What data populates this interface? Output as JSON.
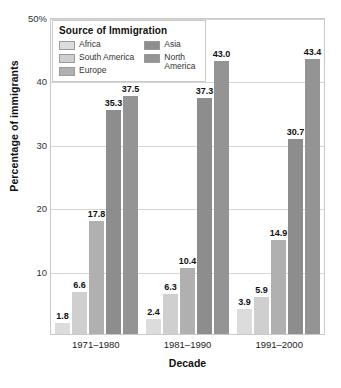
{
  "chart_data": {
    "type": "bar",
    "title": "",
    "xlabel": "Decade",
    "ylabel": "Percentage of immigrants",
    "ylim": [
      0,
      50
    ],
    "yticks": [
      10,
      20,
      30,
      40,
      50
    ],
    "ytick_labels": [
      "10",
      "20",
      "30",
      "40",
      "50%"
    ],
    "grid": true,
    "legend_title": "Source of Immigration",
    "legend_position": "top-left-inside",
    "categories": [
      "1971–1980",
      "1981–1990",
      "1991–2000"
    ],
    "series": [
      {
        "name": "Africa",
        "color": "#dcdcdc",
        "values": [
          1.8,
          2.4,
          3.9
        ]
      },
      {
        "name": "South America",
        "color": "#cfcfcf",
        "values": [
          6.6,
          6.3,
          5.9
        ]
      },
      {
        "name": "Europe",
        "color": "#b0b0b0",
        "values": [
          17.8,
          10.4,
          14.9
        ]
      },
      {
        "name": "Asia",
        "color": "#8d8d8d",
        "values": [
          35.3,
          37.3,
          30.7
        ]
      },
      {
        "name": "North\nAmerica",
        "color": "#949494",
        "values": [
          37.5,
          43.0,
          43.4
        ]
      }
    ],
    "value_labels": [
      [
        "1.8",
        "6.6",
        "17.8",
        "35.3",
        "37.5"
      ],
      [
        "2.4",
        "6.3",
        "10.4",
        "37.3",
        "43.0"
      ],
      [
        "3.9",
        "5.9",
        "14.9",
        "30.7",
        "43.4"
      ]
    ]
  },
  "axes": {
    "y_title": "Percentage of immigrants",
    "x_title": "Decade"
  },
  "legend": {
    "title": "Source of Immigration",
    "left_column": [
      {
        "label": "Africa",
        "color": "#dcdcdc"
      },
      {
        "label": "South America",
        "color": "#cfcfcf"
      },
      {
        "label": "Europe",
        "color": "#b0b0b0"
      }
    ],
    "right_column": [
      {
        "label": "Asia",
        "color": "#8d8d8d"
      },
      {
        "label": "North\nAmerica",
        "color": "#949494"
      }
    ]
  }
}
